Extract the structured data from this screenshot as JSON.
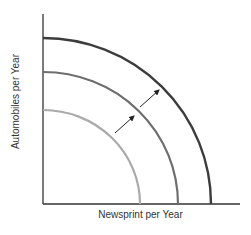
{
  "diagram": {
    "xlabel": "Newsprint per Year",
    "ylabel": "Automobiles per Year",
    "curves": [
      {
        "name": "inner-ppf",
        "color": "#aaaaaa"
      },
      {
        "name": "middle-ppf",
        "color": "#6e6e6e"
      },
      {
        "name": "outer-ppf",
        "color": "#3c3c3c"
      }
    ],
    "arrows": [
      "shift-arrow-1",
      "shift-arrow-2"
    ]
  }
}
